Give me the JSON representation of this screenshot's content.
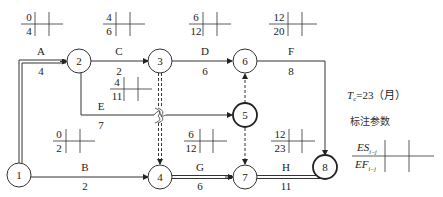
{
  "nodes": [
    {
      "id": "1",
      "label": "1",
      "critical": false
    },
    {
      "id": "2",
      "label": "2",
      "critical": false
    },
    {
      "id": "3",
      "label": "3",
      "critical": false
    },
    {
      "id": "4",
      "label": "4",
      "critical": false
    },
    {
      "id": "5",
      "label": "5",
      "critical": true
    },
    {
      "id": "6",
      "label": "6",
      "critical": false
    },
    {
      "id": "7",
      "label": "7",
      "critical": false
    },
    {
      "id": "8",
      "label": "8",
      "critical": true
    }
  ],
  "activities": [
    {
      "name": "A",
      "duration": "4",
      "from": "1",
      "to": "2",
      "es": "0",
      "ef": "4",
      "critical": true
    },
    {
      "name": "C",
      "duration": "2",
      "from": "2",
      "to": "3",
      "es": "4",
      "ef": "6",
      "critical": false
    },
    {
      "name": "D",
      "duration": "6",
      "from": "3",
      "to": "6",
      "es": "6",
      "ef": "12",
      "critical": false
    },
    {
      "name": "F",
      "duration": "8",
      "from": "6",
      "to": "8",
      "es": "12",
      "ef": "20",
      "critical": false
    },
    {
      "name": "E",
      "duration": "7",
      "from": "2",
      "to": "5",
      "es": "4",
      "ef": "11",
      "critical": false
    },
    {
      "name": "B",
      "duration": "2",
      "from": "1",
      "to": "4",
      "es": "0",
      "ef": "2",
      "critical": false
    },
    {
      "name": "G",
      "duration": "6",
      "from": "4",
      "to": "7",
      "es": "6",
      "ef": "12",
      "critical": true
    },
    {
      "name": "H",
      "duration": "11",
      "from": "7",
      "to": "8",
      "es": "12",
      "ef": "23",
      "critical": true
    }
  ],
  "dummies": [
    {
      "from": "3",
      "to": "4"
    },
    {
      "from": "5",
      "to": "6"
    },
    {
      "from": "5",
      "to": "7"
    }
  ],
  "legend": {
    "tc_symbol": "T",
    "tc_subscript": "c",
    "tc_value": "=23（月）",
    "title": "标注参数",
    "es_label": "ES",
    "es_subscript": "i−j",
    "ef_label": "EF",
    "ef_subscript": "i−j"
  },
  "colors": {
    "line": "#333333",
    "text": "#222222"
  }
}
